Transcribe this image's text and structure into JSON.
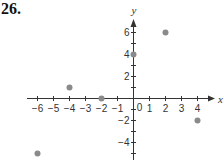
{
  "problem": {
    "number": "26."
  },
  "chart_data": {
    "type": "scatter",
    "title": "",
    "xlabel": "x",
    "ylabel": "y",
    "xlim": [
      -6.5,
      4.8
    ],
    "ylim": [
      -5.6,
      7.2
    ],
    "x_ticks": [
      -6,
      -5,
      -4,
      -3,
      -2,
      -1,
      1,
      2,
      3,
      4
    ],
    "x_tick_labels": [
      "−6",
      "−5",
      "−4",
      "−3",
      "−2",
      "−1",
      "1",
      "2",
      "3",
      "4"
    ],
    "y_ticks": [
      -5,
      -4,
      -3,
      -2,
      -1,
      1,
      2,
      3,
      4,
      5,
      6
    ],
    "y_tick_labels_shown": {
      "6": "6",
      "4": "4",
      "2": "2",
      "-2": "−2",
      "-4": "−4"
    },
    "origin_label": "0",
    "grid": false,
    "legend": null,
    "points": [
      {
        "x": 0,
        "y": 4
      },
      {
        "x": 2,
        "y": 6
      },
      {
        "x": -4,
        "y": 1
      },
      {
        "x": -2,
        "y": 0
      },
      {
        "x": 4,
        "y": -2
      },
      {
        "x": -6,
        "y": -5
      }
    ],
    "point_color": "#8a8a8a",
    "axis_color": "#333333"
  }
}
